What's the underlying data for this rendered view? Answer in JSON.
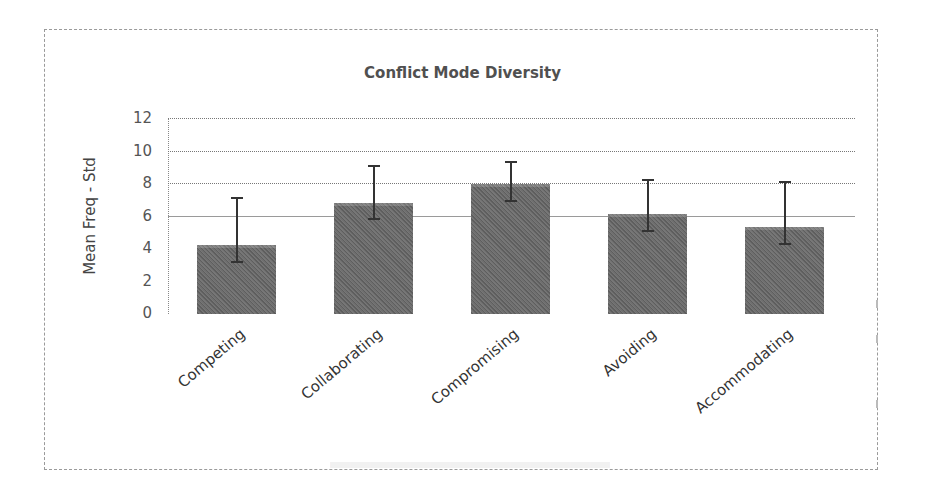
{
  "chart_data": {
    "type": "bar",
    "title": "Conflict Mode Diversity",
    "xlabel": "",
    "ylabel": "Mean Freq - Std",
    "ylim": [
      0,
      12
    ],
    "yticks": [
      "0",
      "2",
      "4",
      "6",
      "8",
      "10",
      "12"
    ],
    "grid": true,
    "legend": null,
    "categories": [
      "Competing",
      "Collaborating",
      "Compromising",
      "Avoiding",
      "Accommodating"
    ],
    "values": [
      4.2,
      6.8,
      8.0,
      6.1,
      5.3
    ],
    "error_bars": {
      "upper": [
        7.1,
        9.1,
        9.3,
        8.2,
        8.1
      ],
      "lower": [
        3.2,
        5.8,
        6.9,
        5.1,
        4.3
      ]
    },
    "bar_color": "#666666"
  }
}
